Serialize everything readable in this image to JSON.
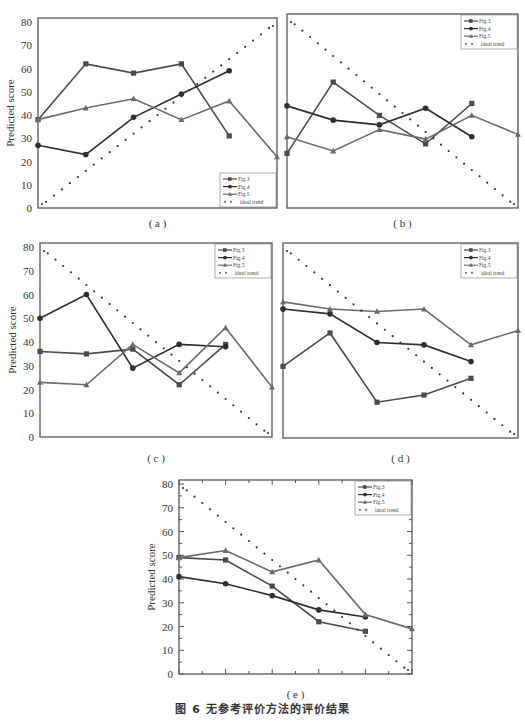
{
  "figure_caption": "图 6   无参考评价方法的评价结果",
  "ylabel": "Predicted score",
  "legend": [
    "Fig.3",
    "Fig.4",
    "Fig.5",
    "ideal trend"
  ],
  "colors": {
    "fig3": "#4a4a4a",
    "fig4": "#2e2e2e",
    "fig5": "#6a6a6a",
    "ideal": "#333333",
    "axis": "#555555"
  },
  "chart_data": [
    {
      "type": "line",
      "panel": "(a)",
      "title": "",
      "xlabel": "",
      "ylabel": "Predicted score",
      "ylim": [
        0,
        80
      ],
      "yticks": [
        0,
        10,
        20,
        30,
        40,
        50,
        60,
        70,
        80
      ],
      "x": [
        1,
        2,
        3,
        4,
        5,
        6
      ],
      "series": [
        {
          "name": "Fig.3",
          "marker": "square",
          "values": [
            38,
            62,
            58,
            62,
            31,
            null
          ]
        },
        {
          "name": "Fig.4",
          "marker": "circle",
          "values": [
            27,
            23,
            39,
            49,
            59,
            null
          ]
        },
        {
          "name": "Fig.5",
          "marker": "triangle",
          "values": [
            38,
            43,
            47,
            38,
            46,
            22
          ]
        },
        {
          "name": "ideal trend",
          "style": "dotted",
          "values": [
            0,
            16,
            32,
            48,
            64,
            80
          ]
        }
      ],
      "legend_position": "lower right"
    },
    {
      "type": "line",
      "panel": "(b)",
      "ylim": [
        0,
        80
      ],
      "x": [
        1,
        2,
        3,
        4,
        5,
        6
      ],
      "series": [
        {
          "name": "Fig.3",
          "marker": "square",
          "values": [
            23,
            53,
            39,
            27,
            44,
            null
          ]
        },
        {
          "name": "Fig.4",
          "marker": "circle",
          "values": [
            43,
            37,
            35,
            42,
            30,
            null
          ]
        },
        {
          "name": "Fig.5",
          "marker": "triangle",
          "values": [
            30,
            24,
            33,
            29,
            39,
            31
          ]
        },
        {
          "name": "ideal trend",
          "style": "dotted",
          "values": [
            80,
            64,
            48,
            32,
            16,
            0
          ]
        }
      ],
      "legend_position": "upper right"
    },
    {
      "type": "line",
      "panel": "(c)",
      "ylabel": "Predicted score",
      "ylim": [
        0,
        80
      ],
      "yticks": [
        0,
        10,
        20,
        30,
        40,
        50,
        60,
        70,
        80
      ],
      "x": [
        1,
        2,
        3,
        4,
        5,
        6
      ],
      "series": [
        {
          "name": "Fig.3",
          "marker": "square",
          "values": [
            36,
            35,
            37,
            22,
            39,
            null
          ]
        },
        {
          "name": "Fig.4",
          "marker": "circle",
          "values": [
            50,
            60,
            29,
            39,
            38,
            null
          ]
        },
        {
          "name": "Fig.5",
          "marker": "triangle",
          "values": [
            23,
            22,
            39,
            27,
            46,
            21
          ]
        },
        {
          "name": "ideal trend",
          "style": "dotted",
          "values": [
            80,
            64,
            48,
            32,
            16,
            0
          ]
        }
      ],
      "legend_position": "upper right"
    },
    {
      "type": "line",
      "panel": "(d)",
      "ylim": [
        0,
        80
      ],
      "x": [
        1,
        2,
        3,
        4,
        5,
        6
      ],
      "series": [
        {
          "name": "Fig.3",
          "marker": "square",
          "values": [
            30,
            44,
            15,
            18,
            25,
            null
          ]
        },
        {
          "name": "Fig.4",
          "marker": "circle",
          "values": [
            54,
            52,
            40,
            39,
            32,
            null
          ]
        },
        {
          "name": "Fig.5",
          "marker": "triangle",
          "values": [
            57,
            54,
            53,
            54,
            39,
            45
          ]
        },
        {
          "name": "ideal trend",
          "style": "dotted",
          "values": [
            80,
            64,
            48,
            32,
            16,
            0
          ]
        }
      ],
      "legend_position": "upper right"
    },
    {
      "type": "line",
      "panel": "(e)",
      "ylabel": "Predicted score",
      "ylim": [
        0,
        80
      ],
      "yticks": [
        0,
        10,
        20,
        30,
        40,
        50,
        60,
        70,
        80
      ],
      "x": [
        1,
        2,
        3,
        4,
        5,
        6
      ],
      "series": [
        {
          "name": "Fig.3",
          "marker": "square",
          "values": [
            49,
            48,
            37,
            22,
            18,
            null
          ]
        },
        {
          "name": "Fig.4",
          "marker": "circle",
          "values": [
            41,
            38,
            33,
            27,
            24,
            null
          ]
        },
        {
          "name": "Fig.5",
          "marker": "triangle",
          "values": [
            49,
            52,
            43,
            48,
            25,
            19
          ]
        },
        {
          "name": "ideal trend",
          "style": "dotted",
          "values": [
            80,
            64,
            48,
            32,
            16,
            0
          ]
        }
      ],
      "legend_position": "upper right"
    }
  ],
  "panels_layout": [
    {
      "x0": 38,
      "x1": 277,
      "y0": 18,
      "y1": 208,
      "yaxis_labels": true,
      "label_y": 223
    },
    {
      "x0": 287,
      "x1": 518,
      "y0": 14,
      "y1": 208,
      "yaxis_labels": false,
      "label_y": 223
    },
    {
      "x0": 40,
      "x1": 272,
      "y0": 243,
      "y1": 437,
      "yaxis_labels": true,
      "label_y": 458
    },
    {
      "x0": 283,
      "x1": 518,
      "y0": 243,
      "y1": 438,
      "yaxis_labels": false,
      "label_y": 458
    },
    {
      "x0": 179,
      "x1": 412,
      "y0": 480,
      "y1": 674,
      "yaxis_labels": true,
      "label_y": 694,
      "ticks": true
    }
  ]
}
